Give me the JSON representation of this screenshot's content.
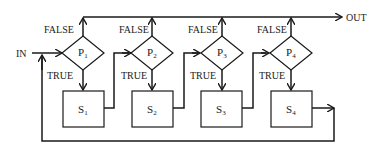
{
  "diagram": {
    "type": "flowchart",
    "input_label": "IN",
    "output_label": "OUT",
    "branch_labels": {
      "false": "FALSE",
      "true": "TRUE"
    },
    "decisions": [
      {
        "id": "P1",
        "letter": "P",
        "sub": "1"
      },
      {
        "id": "P2",
        "letter": "P",
        "sub": "2"
      },
      {
        "id": "P3",
        "letter": "P",
        "sub": "3"
      },
      {
        "id": "P4",
        "letter": "P",
        "sub": "4"
      }
    ],
    "statements": [
      {
        "id": "S1",
        "letter": "S",
        "sub": "1"
      },
      {
        "id": "S2",
        "letter": "S",
        "sub": "2"
      },
      {
        "id": "S3",
        "letter": "S",
        "sub": "3"
      },
      {
        "id": "S4",
        "letter": "S",
        "sub": "4"
      }
    ],
    "edges": [
      {
        "from": "IN",
        "to": "P1"
      },
      {
        "from": "P1",
        "to": "OUT",
        "label": "FALSE"
      },
      {
        "from": "P1",
        "to": "S1",
        "label": "TRUE"
      },
      {
        "from": "S1",
        "to": "P2"
      },
      {
        "from": "P2",
        "to": "OUT",
        "label": "FALSE"
      },
      {
        "from": "P2",
        "to": "S2",
        "label": "TRUE"
      },
      {
        "from": "S2",
        "to": "P3"
      },
      {
        "from": "P3",
        "to": "OUT",
        "label": "FALSE"
      },
      {
        "from": "P3",
        "to": "S3",
        "label": "TRUE"
      },
      {
        "from": "S3",
        "to": "P4"
      },
      {
        "from": "P4",
        "to": "OUT",
        "label": "FALSE"
      },
      {
        "from": "P4",
        "to": "S4",
        "label": "TRUE"
      },
      {
        "from": "S4",
        "to": "P1"
      }
    ]
  }
}
